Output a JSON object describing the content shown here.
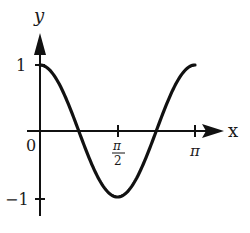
{
  "chart_data": {
    "type": "line",
    "title": "",
    "function": "y = cos(2x)",
    "xlabel": "x",
    "ylabel": "y",
    "xlim": [
      0,
      3.14159
    ],
    "ylim": [
      -1,
      1
    ],
    "x_ticks": [
      {
        "value": 0,
        "label": "0"
      },
      {
        "value": 1.5708,
        "label": "π/2"
      },
      {
        "value": 3.14159,
        "label": "π"
      }
    ],
    "y_ticks": [
      {
        "value": 1,
        "label": "1"
      },
      {
        "value": -1,
        "label": "−1"
      }
    ],
    "series": [
      {
        "name": "cos(2x)",
        "x": [
          0,
          0.3927,
          0.7854,
          1.1781,
          1.5708,
          1.9635,
          2.3562,
          2.7489,
          3.14159
        ],
        "values": [
          1,
          0.7071,
          0,
          -0.7071,
          -1,
          -0.7071,
          0,
          0.7071,
          1
        ]
      }
    ],
    "grid": false,
    "legend": null
  },
  "labels": {
    "x_axis": "x",
    "y_axis": "y",
    "origin": "0",
    "y_one": "1",
    "y_neg_one": "−1",
    "pi_num": "π",
    "pi_den": "2",
    "pi": "π"
  },
  "colors": {
    "curve": "#111111",
    "axes": "#111111"
  }
}
